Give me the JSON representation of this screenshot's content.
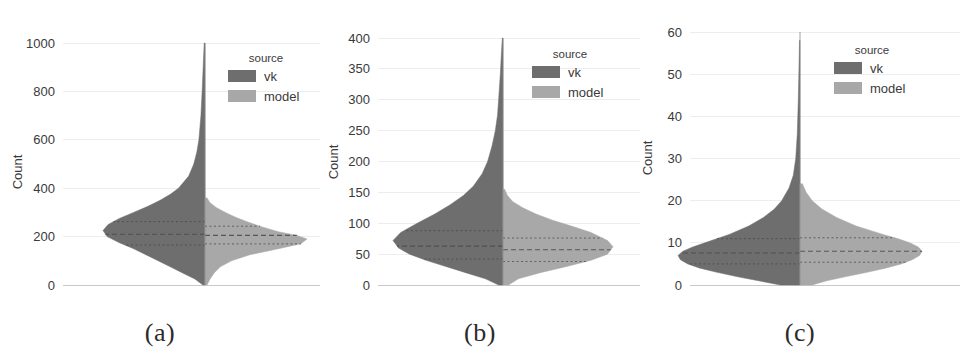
{
  "figure": {
    "panels": [
      {
        "caption": "(a)",
        "ylabel": "Count",
        "legend": {
          "title": "source",
          "entries": [
            "vk",
            "model"
          ]
        },
        "colors": {
          "vk": "#6e6e6e",
          "model": "#a8a8a8",
          "grid": "#ededed",
          "axis_text": "#3a3a3a"
        }
      },
      {
        "caption": "(b)",
        "ylabel": "Count",
        "legend": {
          "title": "source",
          "entries": [
            "vk",
            "model"
          ]
        },
        "colors": {
          "vk": "#6e6e6e",
          "model": "#a8a8a8",
          "grid": "#ededed",
          "axis_text": "#3a3a3a"
        }
      },
      {
        "caption": "(c)",
        "ylabel": "Count",
        "legend": {
          "title": "source",
          "entries": [
            "vk",
            "model"
          ]
        },
        "colors": {
          "vk": "#6e6e6e",
          "model": "#a8a8a8",
          "grid": "#ededed",
          "axis_text": "#3a3a3a"
        }
      }
    ]
  },
  "chart_data": [
    {
      "type": "violin",
      "panel": "(a)",
      "title": "",
      "xlabel": "",
      "ylabel": "Count",
      "ylim": [
        0,
        1000
      ],
      "yticks": [
        0,
        200,
        400,
        600,
        800,
        1000
      ],
      "ytick_labels": [
        "0",
        "200",
        "400",
        "600",
        "800",
        "1000"
      ],
      "grid": true,
      "split": true,
      "legend": {
        "title": "source",
        "position": "upper-right",
        "entries": [
          "vk",
          "model"
        ]
      },
      "series": [
        {
          "name": "vk",
          "side": "left",
          "color": "#6e6e6e",
          "quartiles": {
            "q1": 165,
            "median": 210,
            "q3": 262
          },
          "peak_value": 225,
          "max_value": 1000,
          "min_value": 0,
          "density": [
            {
              "value": 0,
              "width": 0.02
            },
            {
              "value": 25,
              "width": 0.1
            },
            {
              "value": 50,
              "width": 0.22
            },
            {
              "value": 75,
              "width": 0.34
            },
            {
              "value": 100,
              "width": 0.46
            },
            {
              "value": 125,
              "width": 0.58
            },
            {
              "value": 150,
              "width": 0.7
            },
            {
              "value": 175,
              "width": 0.84
            },
            {
              "value": 200,
              "width": 0.96
            },
            {
              "value": 225,
              "width": 1.0
            },
            {
              "value": 250,
              "width": 0.95
            },
            {
              "value": 275,
              "width": 0.84
            },
            {
              "value": 300,
              "width": 0.7
            },
            {
              "value": 325,
              "width": 0.56
            },
            {
              "value": 350,
              "width": 0.44
            },
            {
              "value": 375,
              "width": 0.34
            },
            {
              "value": 400,
              "width": 0.26
            },
            {
              "value": 450,
              "width": 0.16
            },
            {
              "value": 500,
              "width": 0.11
            },
            {
              "value": 550,
              "width": 0.08
            },
            {
              "value": 600,
              "width": 0.06
            },
            {
              "value": 700,
              "width": 0.04
            },
            {
              "value": 800,
              "width": 0.028
            },
            {
              "value": 900,
              "width": 0.018
            },
            {
              "value": 1000,
              "width": 0.008
            }
          ]
        },
        {
          "name": "model",
          "side": "right",
          "color": "#a8a8a8",
          "quartiles": {
            "q1": 170,
            "median": 205,
            "q3": 243
          },
          "peak_value": 205,
          "max_value": 330,
          "min_value": 0,
          "density": [
            {
              "value": 0,
              "width": 0.02
            },
            {
              "value": 25,
              "width": 0.05
            },
            {
              "value": 50,
              "width": 0.09
            },
            {
              "value": 75,
              "width": 0.15
            },
            {
              "value": 100,
              "width": 0.26
            },
            {
              "value": 125,
              "width": 0.44
            },
            {
              "value": 150,
              "width": 0.72
            },
            {
              "value": 170,
              "width": 0.94
            },
            {
              "value": 190,
              "width": 1.0
            },
            {
              "value": 205,
              "width": 0.9
            },
            {
              "value": 220,
              "width": 0.72
            },
            {
              "value": 240,
              "width": 0.56
            },
            {
              "value": 260,
              "width": 0.42
            },
            {
              "value": 280,
              "width": 0.3
            },
            {
              "value": 300,
              "width": 0.2
            },
            {
              "value": 320,
              "width": 0.11
            },
            {
              "value": 340,
              "width": 0.05
            },
            {
              "value": 360,
              "width": 0.02
            }
          ]
        }
      ]
    },
    {
      "type": "violin",
      "panel": "(b)",
      "title": "",
      "xlabel": "",
      "ylabel": "Count",
      "ylim": [
        0,
        400
      ],
      "yticks": [
        0,
        50,
        100,
        150,
        200,
        250,
        300,
        350,
        400
      ],
      "ytick_labels": [
        "0",
        "50",
        "100",
        "150",
        "200",
        "250",
        "300",
        "350",
        "400"
      ],
      "grid": true,
      "split": true,
      "legend": {
        "title": "source",
        "position": "upper-right",
        "entries": [
          "vk",
          "model"
        ]
      },
      "series": [
        {
          "name": "vk",
          "side": "left",
          "color": "#6e6e6e",
          "quartiles": {
            "q1": 42,
            "median": 63,
            "q3": 88
          },
          "peak_value": 72,
          "max_value": 400,
          "min_value": 0,
          "density": [
            {
              "value": 0,
              "width": 0.04
            },
            {
              "value": 10,
              "width": 0.16
            },
            {
              "value": 20,
              "width": 0.34
            },
            {
              "value": 30,
              "width": 0.52
            },
            {
              "value": 40,
              "width": 0.7
            },
            {
              "value": 50,
              "width": 0.85
            },
            {
              "value": 60,
              "width": 0.95
            },
            {
              "value": 72,
              "width": 1.0
            },
            {
              "value": 85,
              "width": 0.93
            },
            {
              "value": 100,
              "width": 0.78
            },
            {
              "value": 115,
              "width": 0.62
            },
            {
              "value": 130,
              "width": 0.48
            },
            {
              "value": 145,
              "width": 0.36
            },
            {
              "value": 160,
              "width": 0.27
            },
            {
              "value": 180,
              "width": 0.19
            },
            {
              "value": 200,
              "width": 0.14
            },
            {
              "value": 225,
              "width": 0.1
            },
            {
              "value": 250,
              "width": 0.07
            },
            {
              "value": 275,
              "width": 0.05
            },
            {
              "value": 300,
              "width": 0.04
            },
            {
              "value": 340,
              "width": 0.025
            },
            {
              "value": 380,
              "width": 0.013
            },
            {
              "value": 400,
              "width": 0.006
            }
          ]
        },
        {
          "name": "model",
          "side": "right",
          "color": "#a8a8a8",
          "quartiles": {
            "q1": 38,
            "median": 57,
            "q3": 76
          },
          "peak_value": 62,
          "max_value": 135,
          "min_value": 0,
          "density": [
            {
              "value": 0,
              "width": 0.05
            },
            {
              "value": 10,
              "width": 0.14
            },
            {
              "value": 20,
              "width": 0.34
            },
            {
              "value": 30,
              "width": 0.58
            },
            {
              "value": 40,
              "width": 0.8
            },
            {
              "value": 50,
              "width": 0.95
            },
            {
              "value": 62,
              "width": 1.0
            },
            {
              "value": 72,
              "width": 0.95
            },
            {
              "value": 85,
              "width": 0.8
            },
            {
              "value": 95,
              "width": 0.63
            },
            {
              "value": 105,
              "width": 0.45
            },
            {
              "value": 115,
              "width": 0.3
            },
            {
              "value": 125,
              "width": 0.18
            },
            {
              "value": 135,
              "width": 0.09
            },
            {
              "value": 145,
              "width": 0.04
            },
            {
              "value": 155,
              "width": 0.015
            }
          ]
        }
      ]
    },
    {
      "type": "violin",
      "panel": "(c)",
      "title": "",
      "xlabel": "",
      "ylabel": "Count",
      "ylim": [
        0,
        60
      ],
      "yticks": [
        0,
        10,
        20,
        30,
        40,
        50,
        60
      ],
      "ytick_labels": [
        "0",
        "10",
        "20",
        "30",
        "40",
        "50",
        "60"
      ],
      "grid": true,
      "split": true,
      "legend": {
        "title": "source",
        "position": "upper-right",
        "entries": [
          "vk",
          "model"
        ]
      },
      "series": [
        {
          "name": "vk",
          "side": "left",
          "color": "#6e6e6e",
          "quartiles": {
            "q1": 5.0,
            "median": 7.6,
            "q3": 11.0
          },
          "peak_value": 7,
          "max_value": 58,
          "min_value": 0,
          "density": [
            {
              "value": 0,
              "width": 0.16
            },
            {
              "value": 1,
              "width": 0.34
            },
            {
              "value": 2,
              "width": 0.52
            },
            {
              "value": 3,
              "width": 0.68
            },
            {
              "value": 4,
              "width": 0.82
            },
            {
              "value": 5,
              "width": 0.92
            },
            {
              "value": 6,
              "width": 0.98
            },
            {
              "value": 7,
              "width": 1.0
            },
            {
              "value": 8,
              "width": 0.96
            },
            {
              "value": 9,
              "width": 0.88
            },
            {
              "value": 10,
              "width": 0.78
            },
            {
              "value": 12,
              "width": 0.58
            },
            {
              "value": 14,
              "width": 0.42
            },
            {
              "value": 16,
              "width": 0.3
            },
            {
              "value": 18,
              "width": 0.21
            },
            {
              "value": 20,
              "width": 0.15
            },
            {
              "value": 23,
              "width": 0.09
            },
            {
              "value": 26,
              "width": 0.055
            },
            {
              "value": 30,
              "width": 0.035
            },
            {
              "value": 36,
              "width": 0.022
            },
            {
              "value": 44,
              "width": 0.014
            },
            {
              "value": 52,
              "width": 0.008
            },
            {
              "value": 58,
              "width": 0.004
            }
          ]
        },
        {
          "name": "model",
          "side": "right",
          "color": "#a8a8a8",
          "quartiles": {
            "q1": 5.4,
            "median": 8.0,
            "q3": 11.2
          },
          "peak_value": 8,
          "max_value": 24,
          "min_value": 0,
          "density": [
            {
              "value": 0,
              "width": 0.1
            },
            {
              "value": 1,
              "width": 0.22
            },
            {
              "value": 2,
              "width": 0.38
            },
            {
              "value": 3,
              "width": 0.55
            },
            {
              "value": 4,
              "width": 0.7
            },
            {
              "value": 5,
              "width": 0.83
            },
            {
              "value": 6,
              "width": 0.92
            },
            {
              "value": 7,
              "width": 0.98
            },
            {
              "value": 8,
              "width": 1.0
            },
            {
              "value": 9,
              "width": 0.97
            },
            {
              "value": 10,
              "width": 0.9
            },
            {
              "value": 11,
              "width": 0.8
            },
            {
              "value": 12,
              "width": 0.68
            },
            {
              "value": 14,
              "width": 0.46
            },
            {
              "value": 16,
              "width": 0.3
            },
            {
              "value": 18,
              "width": 0.18
            },
            {
              "value": 20,
              "width": 0.1
            },
            {
              "value": 22,
              "width": 0.05
            },
            {
              "value": 24,
              "width": 0.02
            }
          ]
        }
      ]
    }
  ]
}
